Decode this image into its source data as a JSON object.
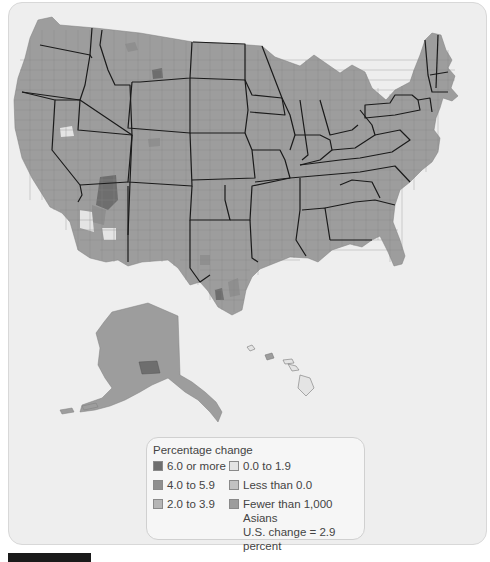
{
  "legend": {
    "title": "Percentage change",
    "items": [
      {
        "label": "6.0 or more",
        "color": "#6e6e6e"
      },
      {
        "label": "4.0 to 5.9",
        "color": "#8f8f8f"
      },
      {
        "label": "2.0 to 3.9",
        "color": "#b5b5b5"
      },
      {
        "label": "0.0 to 1.9",
        "color": "#e4e4e4"
      },
      {
        "label": "Less than 0.0",
        "color": "#c2c2c2"
      },
      {
        "label": "Fewer than 1,000 Asians",
        "color": "#9d9d9d"
      }
    ],
    "note": "U.S. change = 2.9 percent"
  },
  "map": {
    "subject": "Percentage change in Asian population by county, United States",
    "regions": [
      "Contiguous United States",
      "Alaska",
      "Hawaii"
    ]
  }
}
